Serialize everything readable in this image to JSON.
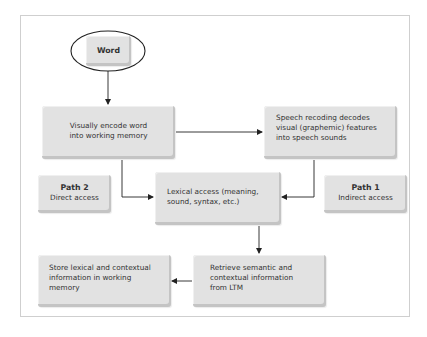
{
  "diagram": {
    "type": "flowchart",
    "nodes": {
      "word": {
        "label": "Word"
      },
      "visual_encode": {
        "label": "Visually encode word\ninto working memory"
      },
      "speech_recoding": {
        "label": "Speech recoding decodes\nvisual (graphemic) features\ninto speech sounds"
      },
      "path2": {
        "title": "Path 2",
        "subtitle": "Direct access"
      },
      "lexical_access": {
        "label": "Lexical access (meaning,\nsound, syntax, etc.)"
      },
      "path1": {
        "title": "Path 1",
        "subtitle": "Indirect access"
      },
      "store": {
        "label": "Store lexical and contextual\ninformation in working\nmemory"
      },
      "retrieve": {
        "label": "Retrieve semantic and\ncontextual information\nfrom LTM"
      }
    },
    "edges": [
      {
        "from": "word",
        "to": "visual_encode"
      },
      {
        "from": "visual_encode",
        "to": "speech_recoding"
      },
      {
        "from": "visual_encode",
        "to": "lexical_access",
        "label": "Path 2"
      },
      {
        "from": "speech_recoding",
        "to": "lexical_access",
        "label": "Path 1"
      },
      {
        "from": "lexical_access",
        "to": "retrieve"
      },
      {
        "from": "retrieve",
        "to": "store"
      }
    ],
    "colors": {
      "box_fill": "#e2e2e2",
      "box_shadow": "#c4c4c4",
      "frame_border": "#cfcfcf",
      "line": "#222222",
      "text": "#333333"
    }
  }
}
